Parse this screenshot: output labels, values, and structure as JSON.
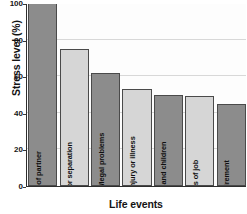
{
  "chart_data": {
    "type": "bar",
    "title": "",
    "xlabel": "Life events",
    "ylabel": "Stress level (%)",
    "categories": [
      "Death of partner",
      "Divorce or separation",
      "Prison term/legal problems",
      "Personal injury or illness",
      "Marriage and children",
      "Loss of job",
      "Retirement"
    ],
    "values": [
      100,
      75,
      62,
      53,
      50,
      49,
      45
    ],
    "ylim": [
      0,
      100
    ],
    "yticks": [
      0,
      20,
      40,
      60,
      80,
      100
    ],
    "ytick_labels": [
      "0",
      "20",
      "40",
      "60",
      "80",
      "100"
    ],
    "grid": true,
    "legend": "none",
    "bar_colors": [
      "#8c8c8c",
      "#d6d6d6",
      "#8c8c8c",
      "#d6d6d6",
      "#8c8c8c",
      "#d6d6d6",
      "#8c8c8c"
    ],
    "bar_border_color": "#4a4a4a",
    "gridline_color": "#d8d8d8",
    "axis_color": "#2e2e2e",
    "text_color": "#141414",
    "background": "#ffffff"
  }
}
